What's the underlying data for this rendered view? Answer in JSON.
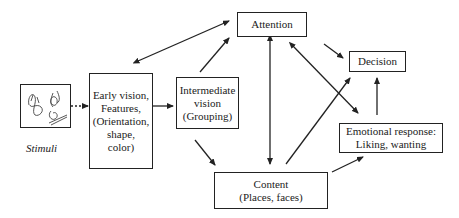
{
  "diagram": {
    "nodes": {
      "stimuli": {
        "caption": "Stimuli"
      },
      "early_vision": {
        "label": "Early vision, Features, (Orientation, shape, color)",
        "lines": [
          "Early vision,",
          "Features,",
          "(Orientation,",
          "shape,",
          "color)"
        ]
      },
      "intermediate_vision": {
        "lines": [
          "Intermediate",
          "vision",
          "(Grouping)"
        ]
      },
      "attention": {
        "label": "Attention"
      },
      "decision": {
        "label": "Decision"
      },
      "emotional_response": {
        "lines": [
          "Emotional response:",
          "Liking, wanting"
        ]
      },
      "content": {
        "lines": [
          "Content",
          "(Places, faces)"
        ]
      }
    },
    "edges": [
      {
        "from": "Stimuli",
        "to": "Early vision",
        "style": "dashed"
      },
      {
        "from": "Early vision",
        "to": "Intermediate vision"
      },
      {
        "from": "Early vision",
        "to": "Attention",
        "bidirectional": true
      },
      {
        "from": "Intermediate vision",
        "to": "Attention"
      },
      {
        "from": "Intermediate vision",
        "to": "Content"
      },
      {
        "from": "Attention",
        "to": "Content",
        "bidirectional": true
      },
      {
        "from": "Attention",
        "to": "Decision"
      },
      {
        "from": "Attention",
        "to": "Emotional response",
        "bidirectional": true
      },
      {
        "from": "Content",
        "to": "Decision"
      },
      {
        "from": "Content",
        "to": "Emotional response"
      },
      {
        "from": "Emotional response",
        "to": "Decision"
      }
    ]
  }
}
